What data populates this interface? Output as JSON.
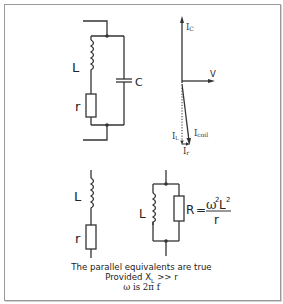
{
  "diagram": {
    "top_circuit": {
      "inductor_label": "L",
      "resistor_label": "r",
      "capacitor_label": "C"
    },
    "phasor": {
      "ic_label": "I",
      "ic_sub": "C",
      "v_label": "V",
      "il_label": "I",
      "il_sub": "L",
      "icoil_label": "I",
      "icoil_sub": "coil",
      "ir_label": "I",
      "ir_sub": "r"
    },
    "series_equivalent": {
      "inductor_label": "L",
      "resistor_label": "r"
    },
    "parallel_equivalent": {
      "inductor_label": "L",
      "resistor_formula_lhs": "R",
      "equals": "=",
      "numerator": "ω",
      "numerator_exp": "2",
      "numerator_L": "L",
      "numerator_L_exp": "2",
      "denominator": "r"
    },
    "caption": {
      "line1": "The parallel equivalents are true",
      "line2_prefix": "Provided X",
      "line2_sub": "L",
      "line2_suffix": " >> r",
      "line3": "ω is 2π f"
    },
    "colors": {
      "stroke": "#333333",
      "frame": "#9a9a9a"
    }
  }
}
